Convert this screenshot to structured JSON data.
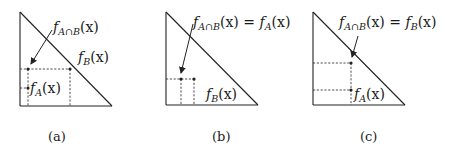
{
  "figure": {
    "panels": [
      {
        "id": "a",
        "caption": "(a)",
        "labels": {
          "intersection": {
            "f": "f",
            "sub": "A∩B",
            "arg": "(x)"
          },
          "fb": {
            "f": "f",
            "sub": "B",
            "arg": "(x)"
          },
          "fa": {
            "f": "f",
            "sub": "A",
            "arg": "(x)"
          }
        }
      },
      {
        "id": "b",
        "caption": "(b)",
        "labels": {
          "intersection": {
            "f": "f",
            "sub": "A∩B",
            "arg": "(x)",
            "eq": " = ",
            "rhs_f": "f",
            "rhs_sub": "A",
            "rhs_arg": "(x)"
          },
          "fb": {
            "f": "f",
            "sub": "B",
            "arg": "(x)"
          }
        }
      },
      {
        "id": "c",
        "caption": "(c)",
        "labels": {
          "intersection": {
            "f": "f",
            "sub": "A∩B",
            "arg": "(x)",
            "eq": " = ",
            "rhs_f": "f",
            "rhs_sub": "B",
            "rhs_arg": "(x)"
          },
          "fa": {
            "f": "f",
            "sub": "A",
            "arg": "(x)"
          }
        }
      }
    ],
    "colors": {
      "ink": "#222222",
      "background": "#ffffff"
    }
  }
}
